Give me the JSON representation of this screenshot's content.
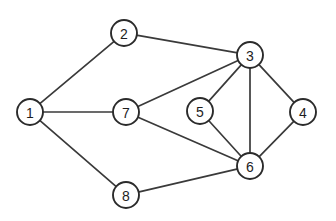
{
  "figure": {
    "background_color": "#ffffff",
    "edge_color": "#3a3a3a",
    "node_fill_color": "#ffffff",
    "node_stroke_color": "#2b2b2b",
    "label_color": "#1d1d1d",
    "node_radius": 13,
    "edge_width": 1.7,
    "node_stroke_width": 1.9,
    "width": 336,
    "height": 221
  },
  "chart_data": {
    "type": "diagram",
    "subtype": "node-link-graph",
    "directed": false,
    "weighted": false,
    "title": "",
    "xlabel": "",
    "ylabel": "",
    "grid": false,
    "legend": false,
    "node_count": 8,
    "edge_count": 12,
    "nodes": [
      {
        "id": "1",
        "label": "1",
        "x": 30,
        "y": 112
      },
      {
        "id": "2",
        "label": "2",
        "x": 124,
        "y": 33
      },
      {
        "id": "3",
        "label": "3",
        "x": 250,
        "y": 55
      },
      {
        "id": "4",
        "label": "4",
        "x": 303,
        "y": 112
      },
      {
        "id": "5",
        "label": "5",
        "x": 200,
        "y": 111
      },
      {
        "id": "6",
        "label": "6",
        "x": 250,
        "y": 166
      },
      {
        "id": "7",
        "label": "7",
        "x": 126,
        "y": 112
      },
      {
        "id": "8",
        "label": "8",
        "x": 126,
        "y": 195
      }
    ],
    "edges": [
      {
        "source": "1",
        "target": "2"
      },
      {
        "source": "1",
        "target": "7"
      },
      {
        "source": "1",
        "target": "8"
      },
      {
        "source": "2",
        "target": "3"
      },
      {
        "source": "3",
        "target": "7"
      },
      {
        "source": "3",
        "target": "5"
      },
      {
        "source": "3",
        "target": "6"
      },
      {
        "source": "3",
        "target": "4"
      },
      {
        "source": "4",
        "target": "6"
      },
      {
        "source": "5",
        "target": "6"
      },
      {
        "source": "6",
        "target": "7"
      },
      {
        "source": "6",
        "target": "8"
      }
    ],
    "adjacency": {
      "1": [
        "2",
        "7",
        "8"
      ],
      "2": [
        "1",
        "3"
      ],
      "3": [
        "2",
        "4",
        "5",
        "6",
        "7"
      ],
      "4": [
        "3",
        "6"
      ],
      "5": [
        "3",
        "6"
      ],
      "6": [
        "3",
        "4",
        "5",
        "7",
        "8"
      ],
      "7": [
        "1",
        "3",
        "6"
      ],
      "8": [
        "1",
        "6"
      ]
    },
    "degrees": {
      "1": 3,
      "2": 2,
      "3": 5,
      "4": 2,
      "5": 2,
      "6": 5,
      "7": 3,
      "8": 2
    }
  }
}
